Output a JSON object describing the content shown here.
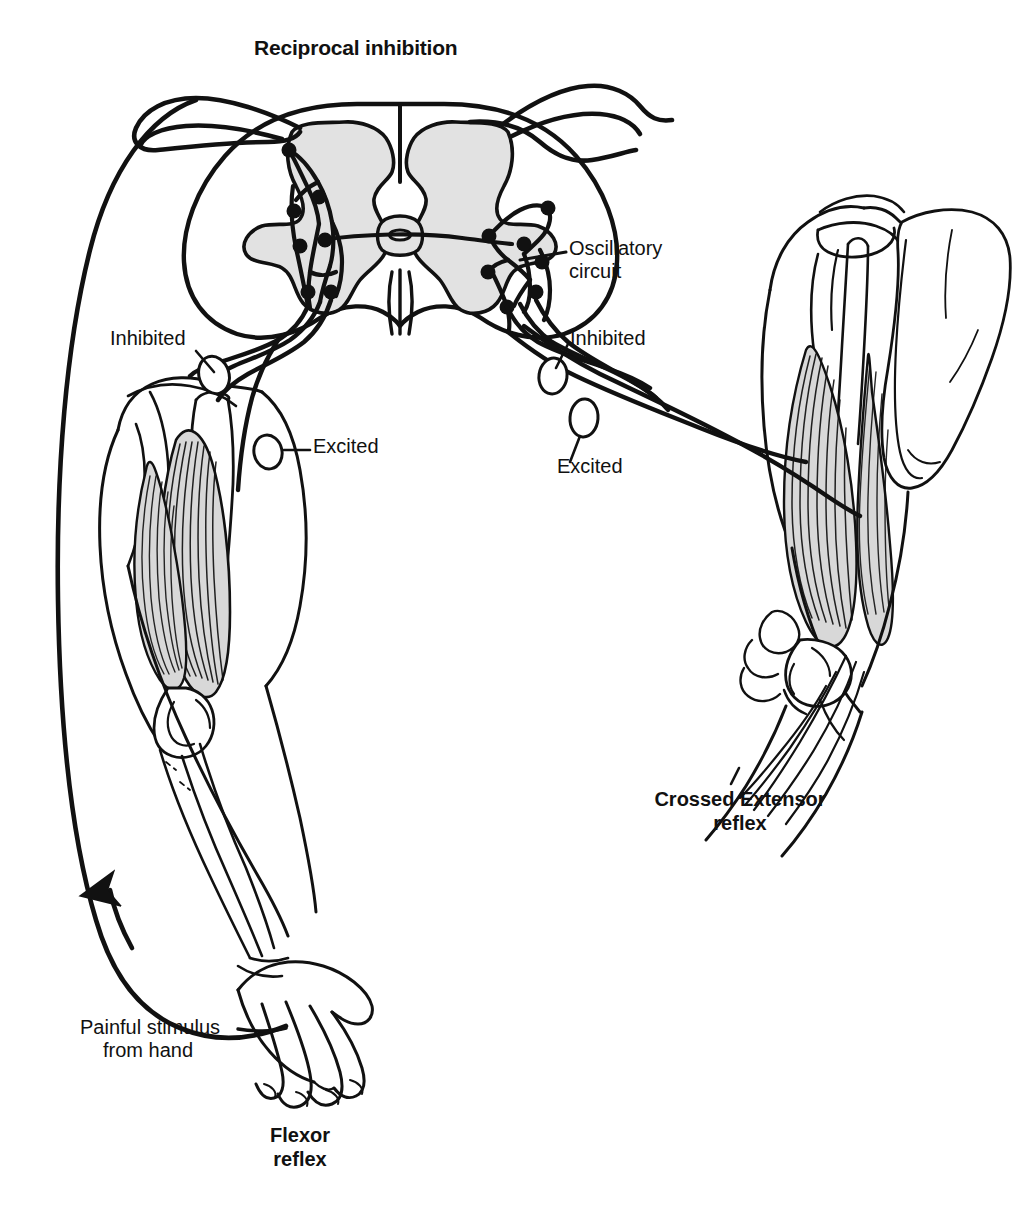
{
  "figure": {
    "title": "Reciprocal inhibition",
    "background_color": "#ffffff",
    "ink_color": "#111111",
    "gray_matter_color": "#e2e2e2",
    "muscle_fill_color": "#d8d8d8"
  },
  "labels": {
    "oscillatory_circuit_line1": "Oscillatory",
    "oscillatory_circuit_line2": "circuit",
    "left_inhibited": "Inhibited",
    "left_excited": "Excited",
    "right_inhibited": "Inhibited",
    "right_excited": "Excited",
    "painful_stimulus_line1": "Painful stimulus",
    "painful_stimulus_line2": "from hand",
    "flexor_caption_line1": "Flexor",
    "flexor_caption_line2": "reflex",
    "crossed_extensor_caption_line1": "Crossed Extensor",
    "crossed_extensor_caption_line2": "reflex"
  }
}
